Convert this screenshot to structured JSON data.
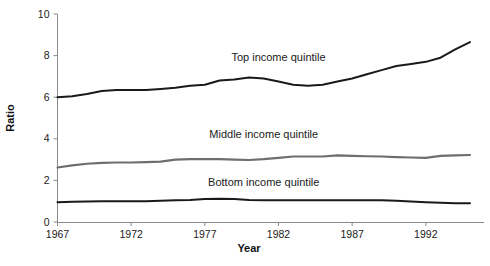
{
  "chart_data": {
    "type": "line",
    "title": "",
    "subtitle": "",
    "xlabel": "Year",
    "ylabel": "Ratio",
    "xlim": [
      1967,
      1995
    ],
    "ylim": [
      0,
      10
    ],
    "x_ticks": [
      1967,
      1972,
      1977,
      1982,
      1987,
      1992
    ],
    "y_ticks": [
      0,
      2,
      4,
      6,
      8,
      10
    ],
    "grid": false,
    "legend_position": "inline-annotations",
    "x": [
      1967,
      1968,
      1969,
      1970,
      1971,
      1972,
      1973,
      1974,
      1975,
      1976,
      1977,
      1978,
      1979,
      1980,
      1981,
      1982,
      1983,
      1984,
      1985,
      1986,
      1987,
      1988,
      1989,
      1990,
      1991,
      1992,
      1993,
      1994,
      1995
    ],
    "series": [
      {
        "name": "Top income quintile",
        "color": "#1a1a1a",
        "label_x": 1982,
        "label_y": 7.75,
        "values": [
          6.0,
          6.05,
          6.15,
          6.3,
          6.35,
          6.35,
          6.35,
          6.4,
          6.45,
          6.55,
          6.6,
          6.8,
          6.85,
          6.95,
          6.9,
          6.75,
          6.6,
          6.55,
          6.6,
          6.75,
          6.9,
          7.1,
          7.3,
          7.5,
          7.6,
          7.7,
          7.9,
          8.3,
          8.65
        ]
      },
      {
        "name": "Middle income quintile",
        "color": "#6e6e6e",
        "label_x": 1981,
        "label_y": 4.05,
        "values": [
          2.62,
          2.72,
          2.8,
          2.84,
          2.86,
          2.86,
          2.88,
          2.9,
          3.0,
          3.02,
          3.02,
          3.02,
          3.0,
          2.98,
          3.02,
          3.08,
          3.15,
          3.15,
          3.15,
          3.2,
          3.18,
          3.16,
          3.15,
          3.12,
          3.1,
          3.08,
          3.18,
          3.2,
          3.22
        ]
      },
      {
        "name": "Bottom income quintile",
        "color": "#1a1a1a",
        "label_x": 1981,
        "label_y": 1.75,
        "values": [
          0.95,
          0.97,
          0.99,
          1.0,
          1.0,
          1.0,
          1.0,
          1.02,
          1.04,
          1.06,
          1.1,
          1.12,
          1.1,
          1.06,
          1.05,
          1.04,
          1.04,
          1.04,
          1.04,
          1.05,
          1.05,
          1.05,
          1.05,
          1.02,
          0.98,
          0.95,
          0.93,
          0.9,
          0.9
        ]
      }
    ]
  },
  "axis": {
    "y_label": "Ratio",
    "x_label": "Year",
    "y_tick_labels": [
      "0",
      "2",
      "4",
      "6",
      "8",
      "10"
    ],
    "x_tick_labels": [
      "1967",
      "1972",
      "1977",
      "1982",
      "1987",
      "1992"
    ]
  },
  "annotations": {
    "top": "Top income quintile",
    "middle": "Middle income quintile",
    "bottom": "Bottom income quintile"
  },
  "colors": {
    "axis": "#8a8a8a",
    "text": "#1a1a1a",
    "top_series": "#1a1a1a",
    "middle_series": "#6e6e6e",
    "bottom_series": "#1a1a1a",
    "background": "#ffffff"
  }
}
